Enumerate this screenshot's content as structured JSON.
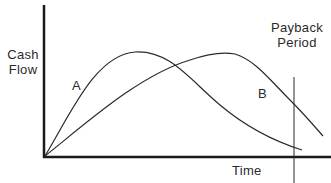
{
  "diagram": {
    "type": "payback-period-cash-flow",
    "axes": {
      "y_label_line1": "Cash",
      "y_label_line2": "Flow",
      "x_label": "Time"
    },
    "curves": [
      {
        "id": "A",
        "label": "A",
        "description": "Early peak, declines sooner"
      },
      {
        "id": "B",
        "label": "B",
        "description": "Later peak, declines later"
      }
    ],
    "marker": {
      "label_line1": "Payback",
      "label_line2": "Period"
    },
    "colors": {
      "line": "#2a2a2a",
      "axis": "#1a1a1a",
      "background": "#ffffff"
    }
  }
}
